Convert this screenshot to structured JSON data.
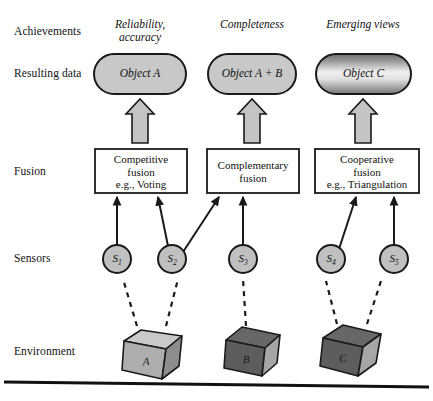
{
  "diagram": {
    "rows": [
      {
        "key": "achievements",
        "label": "Achievements",
        "y": 32
      },
      {
        "key": "resulting_data",
        "label": "Resulting data",
        "y": 74
      },
      {
        "key": "fusion",
        "label": "Fusion",
        "y": 172
      },
      {
        "key": "sensors",
        "label": "Sensors",
        "y": 258
      },
      {
        "key": "environment",
        "label": "Environment",
        "y": 352
      }
    ],
    "achievements": [
      {
        "id": "a1",
        "line1": "Reliability,",
        "line2": "accuracy",
        "cx": 140
      },
      {
        "id": "a2",
        "line1": "Completeness",
        "line2": "",
        "cx": 252
      },
      {
        "id": "a3",
        "line1": "Emerging views",
        "line2": "",
        "cx": 363
      }
    ],
    "resulting_data": [
      {
        "id": "objA",
        "label": "Object A",
        "cx": 140,
        "cy": 74,
        "w": 92,
        "h": 40,
        "fill": "flat-gray"
      },
      {
        "id": "objAB",
        "label": "Object A + B",
        "cx": 252,
        "cy": 74,
        "w": 88,
        "h": 40,
        "fill": "flat-gray"
      },
      {
        "id": "objC",
        "label": "Object C",
        "cx": 363,
        "cy": 74,
        "w": 95,
        "h": 40,
        "fill": "gradient"
      }
    ],
    "block_arrows": [
      {
        "id": "ba1",
        "cx": 140,
        "from_y": 142,
        "to_y": 100
      },
      {
        "id": "ba2",
        "cx": 252,
        "from_y": 142,
        "to_y": 100
      },
      {
        "id": "ba3",
        "cx": 363,
        "from_y": 142,
        "to_y": 100
      }
    ],
    "fusion_boxes": [
      {
        "id": "fb1",
        "lines": [
          "Competitive",
          "fusion",
          "e.g., Voting"
        ],
        "x": 95,
        "y": 149,
        "w": 92,
        "h": 44
      },
      {
        "id": "fb2",
        "lines": [
          "Complementary",
          "fusion"
        ],
        "x": 207,
        "y": 149,
        "w": 92,
        "h": 44
      },
      {
        "id": "fb3",
        "lines": [
          "Cooperative",
          "fusion",
          "e.g., Triangulation"
        ],
        "x": 315,
        "y": 149,
        "w": 104,
        "h": 44
      }
    ],
    "sensors": [
      {
        "id": "s1",
        "label": "S",
        "sub": "1",
        "cx": 117,
        "cy": 259,
        "r": 14
      },
      {
        "id": "s2",
        "label": "S",
        "sub": "2",
        "cx": 172,
        "cy": 259,
        "r": 14
      },
      {
        "id": "s3",
        "label": "S",
        "sub": "3",
        "cx": 243,
        "cy": 259,
        "r": 14
      },
      {
        "id": "s4",
        "label": "S",
        "sub": "4",
        "cx": 331,
        "cy": 259,
        "r": 14
      },
      {
        "id": "s5",
        "label": "S",
        "sub": "5",
        "cx": 394,
        "cy": 259,
        "r": 14
      }
    ],
    "sensor_links": [
      {
        "id": "l1",
        "from": "s1",
        "to": "fb1",
        "x1": 117,
        "y1": 245,
        "x2": 117,
        "y2": 196
      },
      {
        "id": "l2",
        "from": "s2",
        "to": "fb1",
        "x1": 168,
        "y1": 246,
        "x2": 158,
        "y2": 196
      },
      {
        "id": "l3",
        "from": "s2",
        "to": "fb2",
        "x1": 182,
        "y1": 251,
        "x2": 219,
        "y2": 196
      },
      {
        "id": "l4",
        "from": "s3",
        "to": "fb2",
        "x1": 243,
        "y1": 245,
        "x2": 243,
        "y2": 196
      },
      {
        "id": "l5",
        "from": "s4",
        "to": "fb3",
        "x1": 338,
        "y1": 248,
        "x2": 356,
        "y2": 196
      },
      {
        "id": "l6",
        "from": "s5",
        "to": "fb3",
        "x1": 394,
        "y1": 245,
        "x2": 394,
        "y2": 196
      }
    ],
    "environment": [
      {
        "id": "cubeA",
        "label": "A",
        "cx": 153,
        "cy": 348,
        "shade": "light"
      },
      {
        "id": "cubeB",
        "label": "B",
        "cx": 253,
        "cy": 348,
        "shade": "dark"
      },
      {
        "id": "cubeC",
        "label": "C",
        "cx": 350,
        "cy": 348,
        "shade": "dark"
      }
    ],
    "observation_links": [
      {
        "id": "d1",
        "from": "cubeA",
        "to": "s1",
        "x1": 137,
        "y1": 325,
        "x2": 122,
        "y2": 278
      },
      {
        "id": "d2",
        "from": "cubeA",
        "to": "s2",
        "x1": 165,
        "y1": 325,
        "x2": 178,
        "y2": 278
      },
      {
        "id": "d3",
        "from": "cubeB",
        "to": "s3",
        "x1": 245,
        "y1": 325,
        "x2": 243,
        "y2": 278
      },
      {
        "id": "d4",
        "from": "cubeC",
        "to": "s4",
        "x1": 337,
        "y1": 323,
        "x2": 326,
        "y2": 280
      },
      {
        "id": "d5",
        "from": "cubeC",
        "to": "s5",
        "x1": 366,
        "y1": 323,
        "x2": 380,
        "y2": 280
      }
    ],
    "ground_line": {
      "id": "ground",
      "x1": 4,
      "y1": 382,
      "x2": 429,
      "y2": 387
    }
  },
  "colors": {
    "stroke": "#1a1a1a",
    "ellipse_fill": "#c8c8c8",
    "gradient_dark": "#6e6e6e",
    "gradient_light": "#efefef",
    "box_fill": "#ffffff",
    "sensor_fill": "#c0c0c0",
    "arrow_fill": "#c4c4c4",
    "cube_light_top": "#c9c9c9",
    "cube_light_front": "#a9a9a9",
    "cube_light_side": "#8f8f8f",
    "cube_dark_top": "#6a6a6a",
    "cube_dark_front": "#5e5e5e",
    "cube_dark_side": "#a8a8a8",
    "background": "#ffffff"
  }
}
